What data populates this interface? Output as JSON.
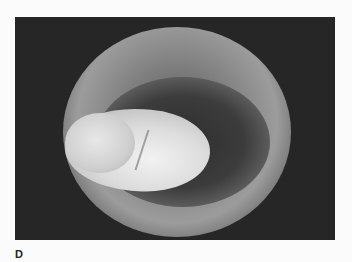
{
  "figure": {
    "panel_label": "D",
    "image_description": "Grayscale endoscopic view of a circular airway lumen with a bright lobulated mass"
  }
}
